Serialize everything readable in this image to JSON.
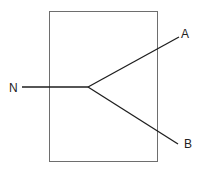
{
  "diagram": {
    "type": "branching line through box",
    "labels": {
      "input": "N",
      "output_top": "A",
      "output_bottom": "B"
    },
    "colors": {
      "box_stroke": "#6e6e6e",
      "line_stroke": "#1e1e1e",
      "background": "#ffffff"
    }
  }
}
